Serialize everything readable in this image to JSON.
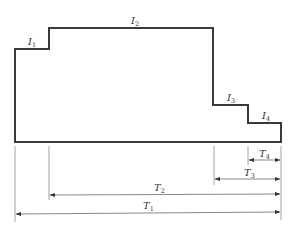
{
  "diagram": {
    "type": "stepped-load-profile",
    "levels": [
      {
        "label": "I",
        "sub": "1"
      },
      {
        "label": "I",
        "sub": "2"
      },
      {
        "label": "I",
        "sub": "3"
      },
      {
        "label": "I",
        "sub": "4"
      }
    ],
    "durations": [
      {
        "label": "T",
        "sub": "1"
      },
      {
        "label": "T",
        "sub": "2"
      },
      {
        "label": "T",
        "sub": "3"
      },
      {
        "label": "T",
        "sub": "4"
      }
    ]
  }
}
